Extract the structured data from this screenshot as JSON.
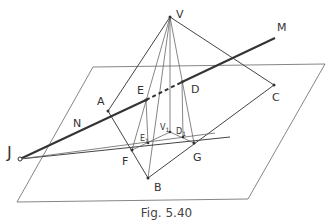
{
  "figure": {
    "caption": "Fig. 5.40",
    "labels": {
      "V": "V",
      "M": "M",
      "A": "A",
      "E": "E",
      "D": "D",
      "C": "C",
      "N": "N",
      "J": "J",
      "F": "F",
      "G": "G",
      "B": "B",
      "E1": "E",
      "E1_sub": "1",
      "V1": "V",
      "V1_sub": "1",
      "D1": "D",
      "D1_sub": "1"
    },
    "colors": {
      "stroke": "#333333",
      "background": "#ffffff"
    }
  }
}
